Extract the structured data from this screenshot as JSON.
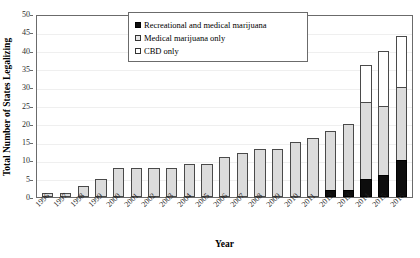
{
  "chart_data": {
    "type": "bar",
    "stacked": true,
    "title": "",
    "xlabel": "Year",
    "ylabel": "Total Number of States Legalizing",
    "ylim": [
      0,
      50
    ],
    "ytick_step": 5,
    "yticks": [
      0,
      5,
      10,
      15,
      20,
      25,
      30,
      35,
      40,
      45,
      50
    ],
    "grid": true,
    "legend_position": "top-center",
    "categories": [
      "1996",
      "1997",
      "1998",
      "1999",
      "2000",
      "2001",
      "2002",
      "2003",
      "2004",
      "2005",
      "2006",
      "2007",
      "2008",
      "2009",
      "2010",
      "2011",
      "2012",
      "2013",
      "2014",
      "2015",
      "2016"
    ],
    "series": [
      {
        "name": "Recreational and medical marijuana",
        "color": "#0d0d0d",
        "values": [
          0,
          0,
          0,
          0,
          0,
          0,
          0,
          0,
          0,
          0,
          0,
          0,
          0,
          0,
          0,
          0,
          2,
          2,
          5,
          6,
          10
        ]
      },
      {
        "name": "Medical marijuana only",
        "color": "#dcdcdc",
        "values": [
          1,
          1,
          3,
          5,
          8,
          8,
          8,
          8,
          9,
          9,
          11,
          12,
          13,
          13,
          15,
          16,
          16,
          18,
          21,
          19,
          20
        ]
      },
      {
        "name": "CBD only",
        "color": "#ffffff",
        "values": [
          0,
          0,
          0,
          0,
          0,
          0,
          0,
          0,
          0,
          0,
          0,
          0,
          0,
          0,
          0,
          0,
          0,
          0,
          10,
          15,
          14
        ]
      }
    ],
    "totals": [
      1,
      1,
      3,
      5,
      8,
      8,
      8,
      8,
      9,
      9,
      11,
      12,
      13,
      13,
      15,
      16,
      18,
      20,
      36,
      40,
      44
    ]
  },
  "legend": {
    "items": [
      {
        "label": "Recreational and medical marijuana",
        "swatch": "filled-black-square"
      },
      {
        "label": "Medical marijuana only",
        "swatch": "light-gray-square"
      },
      {
        "label": "CBD only",
        "swatch": "white-square"
      }
    ]
  },
  "axes": {
    "y_title": "Total Number of States Legalizing",
    "x_title": "Year"
  },
  "top_caption": ""
}
